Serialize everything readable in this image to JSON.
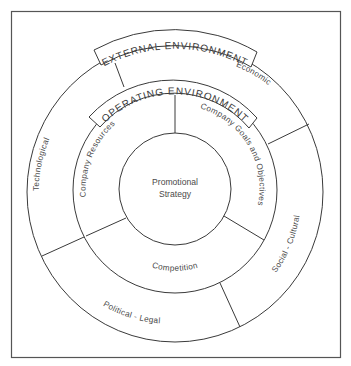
{
  "diagram": {
    "center": {
      "line1": "Promotional",
      "line2": "Strategy"
    },
    "operating_environment": {
      "banner": "OPERATING ENVIRONMENT",
      "segments": [
        {
          "label": "Company Resources"
        },
        {
          "label": "Company Goals and Objectives"
        },
        {
          "label": "Competition"
        }
      ]
    },
    "external_environment": {
      "banner": "EXTERNAL ENVIRONMENT",
      "segments": [
        {
          "label": "Economic"
        },
        {
          "label": "Social - Cultural"
        },
        {
          "label": "Political - Legal"
        },
        {
          "label": "Technological"
        }
      ]
    },
    "colors": {
      "line": "#3a3a3a",
      "text": "#4a4a4a",
      "background": "#ffffff"
    }
  }
}
